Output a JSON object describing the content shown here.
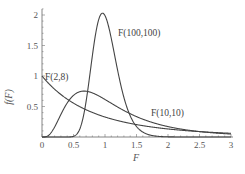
{
  "chart_data": {
    "type": "line",
    "title": "",
    "xlabel": "F",
    "ylabel": "f(F)",
    "xlim": [
      0,
      3
    ],
    "ylim": [
      0,
      2.1
    ],
    "grid": false,
    "legend": "inline labels",
    "x_ticks": [
      "0",
      "0.5",
      "1",
      "1.5",
      "2",
      "2.5",
      "3"
    ],
    "y_ticks": [
      "0.5",
      "1",
      "1.5",
      "2"
    ],
    "series": [
      {
        "name": "F(2,8)",
        "d1": 2,
        "d2": 8,
        "label_x": 45,
        "label_y": 80,
        "points": [
          [
            0,
            1.0
          ],
          [
            0.25,
            0.77
          ],
          [
            0.5,
            0.6
          ],
          [
            0.75,
            0.47
          ],
          [
            1,
            0.37
          ],
          [
            1.5,
            0.24
          ],
          [
            2,
            0.16
          ],
          [
            2.5,
            0.11
          ],
          [
            3,
            0.08
          ]
        ]
      },
      {
        "name": "F(10,10)",
        "d1": 10,
        "d2": 10,
        "label_x": 151,
        "label_y": 116,
        "points": [
          [
            0,
            0
          ],
          [
            0.25,
            0.17
          ],
          [
            0.5,
            0.58
          ],
          [
            0.67,
            0.74
          ],
          [
            1,
            0.62
          ],
          [
            1.5,
            0.32
          ],
          [
            2,
            0.15
          ],
          [
            2.5,
            0.07
          ],
          [
            3,
            0.035
          ]
        ]
      },
      {
        "name": "F(100,100)",
        "d1": 100,
        "d2": 100,
        "label_x": 118,
        "label_y": 36,
        "points": [
          [
            0.5,
            0.0
          ],
          [
            0.7,
            0.55
          ],
          [
            0.8,
            1.45
          ],
          [
            0.96,
            2.0
          ],
          [
            1.1,
            1.55
          ],
          [
            1.3,
            0.45
          ],
          [
            1.5,
            0.08
          ],
          [
            2,
            0.0
          ]
        ]
      }
    ]
  },
  "axes": {
    "xlabel": "F",
    "ylabel": "f(F)"
  }
}
